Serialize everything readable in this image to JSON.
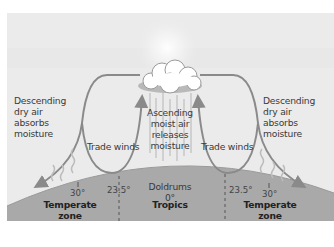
{
  "diagram": {
    "labels": {
      "left_descending": [
        "Descending",
        "dry air",
        "absorbs",
        "moisture"
      ],
      "right_descending": [
        "Descending",
        "dry air",
        "absorbs",
        "moisture"
      ],
      "center_ascending": [
        "Ascending",
        "moist air",
        "releases",
        "moisture"
      ],
      "left_trade_winds": "Trade winds",
      "right_trade_winds": "Trade winds",
      "doldrums": "Doldrums",
      "equator_degree": "0°"
    },
    "latitude_markers": [
      {
        "side": "left",
        "label": "30°"
      },
      {
        "side": "left",
        "label": "23.5°"
      },
      {
        "side": "right",
        "label": "23.5°"
      },
      {
        "side": "right",
        "label": "30°"
      }
    ],
    "zones": [
      {
        "name": "Temperate zone",
        "lines": [
          "Temperate",
          "zone"
        ]
      },
      {
        "name": "Tropics",
        "lines": [
          "Tropics"
        ]
      },
      {
        "name": "Temperate zone",
        "lines": [
          "Temperate",
          "zone"
        ]
      }
    ],
    "icons": [
      "sun-icon",
      "cloud-icon",
      "rain-lines-icon",
      "wavy-evaporation-icon"
    ],
    "colors": {
      "sky": "#ebebeb",
      "ground": "#a9a9a9",
      "arrow": "#8a8a8a",
      "text": "#3a3a3a",
      "background": "#ffffff"
    }
  }
}
